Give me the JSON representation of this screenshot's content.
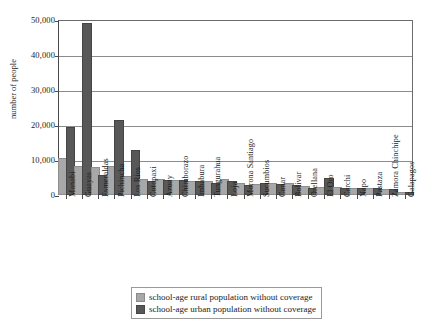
{
  "chart_data": {
    "type": "bar",
    "title": "",
    "xlabel": "",
    "ylabel": "number of people",
    "ylim": [
      0,
      50000
    ],
    "yticks": [
      0,
      10000,
      20000,
      30000,
      40000,
      50000
    ],
    "ytick_labels": [
      "0",
      "10,000",
      "20,000",
      "30,000",
      "40,000",
      "50,000"
    ],
    "grid": true,
    "legend_position": "below-center",
    "categories": [
      "Manabi",
      "Guayas",
      "Esmeraldas",
      "Pichincha",
      "Los Rios",
      "Cotopaxi",
      "Azuay",
      "Chimborazo",
      "Imbabura",
      "Tungurahua",
      "Loja",
      "Morona Santiago",
      "Sucumbios",
      "Canar",
      "Bolivar",
      "Orellana",
      "El Oro",
      "Carchi",
      "Napo",
      "Pastaza",
      "Zamora Chinchipe",
      "Galapagos"
    ],
    "series": [
      {
        "name": "school-age rural population without coverage",
        "color": "#a8a8a8",
        "values": [
          10000,
          7800,
          7500,
          7700,
          5000,
          4000,
          3900,
          3800,
          3400,
          3300,
          3900,
          3000,
          2700,
          2900,
          2800,
          2100,
          1700,
          1600,
          1400,
          1300,
          1200,
          200
        ]
      },
      {
        "name": "school-age urban population without coverage",
        "color": "#585858",
        "values": [
          19000,
          48700,
          5200,
          21000,
          12200,
          3500,
          3800,
          3700,
          3500,
          3000,
          3400,
          2400,
          2900,
          2500,
          2300,
          1400,
          4300,
          1500,
          1300,
          1500,
          1100,
          150
        ]
      }
    ]
  },
  "legend": {
    "items": [
      {
        "label": "school-age rural population without coverage"
      },
      {
        "label": "school-age urban population without coverage"
      }
    ]
  }
}
